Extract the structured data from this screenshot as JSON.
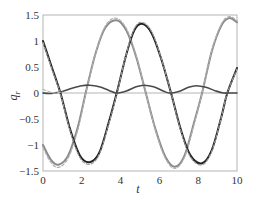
{
  "chart_data": {
    "type": "line",
    "title": "",
    "xlabel": "t",
    "ylabel": "q_r",
    "xlim": [
      0,
      10
    ],
    "ylim": [
      -1.5,
      1.5
    ],
    "xticks": [
      0,
      2,
      4,
      6,
      8,
      10
    ],
    "xtick_labels": [
      "0",
      "2",
      "4",
      "6",
      "8",
      "10"
    ],
    "yticks": [
      1.5,
      1,
      0.5,
      0,
      -0.5,
      -1,
      -1.5
    ],
    "ytick_labels": [
      "1.5",
      "1",
      "0.5",
      "0",
      "−0.5",
      "−1",
      "−1.5"
    ],
    "grid": false,
    "legend": null,
    "zero_line": true,
    "series": [
      {
        "name": "q1 (gray, solid)",
        "color": "#8a8a8a",
        "dash": "",
        "width": 2,
        "x": [
          0,
          0.4,
          0.8,
          1.3,
          1.8,
          2.2,
          2.7,
          3.2,
          3.8,
          4.3,
          4.8,
          5.3,
          5.8,
          6.3,
          6.8,
          7.3,
          7.8,
          8.2,
          8.7,
          9.2,
          9.6,
          10
        ],
        "y": [
          -1.0,
          -1.28,
          -1.38,
          -1.2,
          -0.65,
          0.0,
          0.75,
          1.25,
          1.4,
          1.2,
          0.7,
          0.0,
          -0.7,
          -1.22,
          -1.42,
          -1.2,
          -0.55,
          0.0,
          0.8,
          1.3,
          1.44,
          1.36
        ]
      },
      {
        "name": "q1 reference (gray, dashed)",
        "color": "#b0b0b0",
        "dash": "3,2",
        "width": 1.2,
        "x": [
          0,
          0.4,
          0.8,
          1.3,
          1.8,
          2.2,
          2.7,
          3.2,
          3.75,
          4.3,
          4.8,
          5.3,
          5.8,
          6.3,
          6.8,
          7.3,
          7.8,
          8.2,
          8.7,
          9.2,
          9.6,
          10
        ],
        "y": [
          -1.05,
          -1.33,
          -1.43,
          -1.25,
          -0.7,
          -0.02,
          0.75,
          1.28,
          1.44,
          1.24,
          0.72,
          0.0,
          -0.72,
          -1.25,
          -1.45,
          -1.23,
          -0.58,
          0.0,
          0.82,
          1.33,
          1.47,
          1.39
        ]
      },
      {
        "name": "q2 (black, solid)",
        "color": "#222222",
        "dash": "",
        "width": 2,
        "x": [
          0,
          0.45,
          0.9,
          1.4,
          1.9,
          2.4,
          2.9,
          3.4,
          3.8,
          4.3,
          4.7,
          5.1,
          5.6,
          6.1,
          6.6,
          7.1,
          7.6,
          8.2,
          8.7,
          9.2,
          9.5,
          10
        ],
        "y": [
          1.0,
          0.5,
          0.0,
          -0.7,
          -1.2,
          -1.33,
          -1.15,
          -0.55,
          0.0,
          0.75,
          1.2,
          1.33,
          1.15,
          0.65,
          0.0,
          -0.7,
          -1.2,
          -1.35,
          -1.1,
          -0.45,
          0.0,
          0.48
        ]
      },
      {
        "name": "q2 reference (gray, dashed)",
        "color": "#9a9a9a",
        "dash": "3,2",
        "width": 1.2,
        "x": [
          0,
          0.45,
          0.9,
          1.4,
          1.9,
          2.4,
          2.9,
          3.4,
          3.8,
          4.3,
          4.7,
          5.1,
          5.6,
          6.1,
          6.6,
          7.1,
          7.6,
          8.2,
          8.7,
          9.2,
          9.5,
          10
        ],
        "y": [
          0.97,
          0.47,
          -0.02,
          -0.73,
          -1.24,
          -1.37,
          -1.18,
          -0.58,
          -0.02,
          0.76,
          1.23,
          1.36,
          1.18,
          0.66,
          0.0,
          -0.72,
          -1.23,
          -1.38,
          -1.12,
          -0.46,
          0.0,
          0.46
        ]
      },
      {
        "name": "q3 (dark gray, solid)",
        "color": "#4a4a4a",
        "dash": "",
        "width": 1.6,
        "x": [
          0,
          0.3,
          0.6,
          1.0,
          1.5,
          2.0,
          2.4,
          2.9,
          3.4,
          3.8,
          4.3,
          4.8,
          5.2,
          5.7,
          6.2,
          6.5,
          7.0,
          7.5,
          7.9,
          8.4,
          8.9,
          9.3,
          9.7,
          10
        ],
        "y": [
          0.0,
          -0.01,
          0.0,
          0.03,
          0.09,
          0.14,
          0.15,
          0.12,
          0.05,
          0.0,
          0.04,
          0.12,
          0.15,
          0.12,
          0.04,
          0.0,
          0.03,
          0.11,
          0.14,
          0.11,
          0.04,
          0.0,
          0.0,
          0.0
        ]
      },
      {
        "name": "q3 reference (light gray, dashed)",
        "color": "#b8b8b8",
        "dash": "3,2",
        "width": 1.1,
        "x": [
          0,
          0.3,
          0.6,
          1.0
        ],
        "y": [
          0.07,
          0.03,
          0.0,
          0.02
        ]
      }
    ]
  },
  "axes": {
    "plot_left_px": 43,
    "plot_top_px": 15,
    "plot_right_px": 237,
    "plot_bottom_px": 171,
    "frame_color": "#b5b5b5",
    "zero_line_color": "#b5b5b5"
  }
}
